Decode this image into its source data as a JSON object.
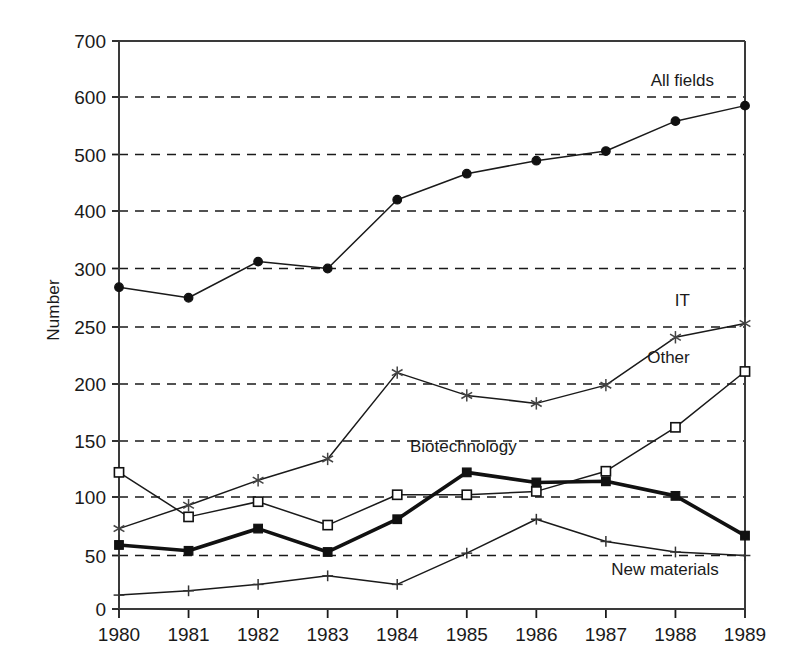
{
  "chart_data": {
    "type": "line",
    "title": "",
    "xlabel": "",
    "ylabel": "Number",
    "categories": [
      "1980",
      "1981",
      "1982",
      "1983",
      "1984",
      "1985",
      "1986",
      "1987",
      "1988",
      "1989"
    ],
    "x": [
      1980,
      1981,
      1982,
      1983,
      1984,
      1985,
      1986,
      1987,
      1988,
      1989
    ],
    "yticks": [
      0,
      50,
      100,
      150,
      200,
      250,
      300,
      400,
      500,
      600,
      700
    ],
    "ytick_labels": [
      "0",
      "50",
      "100",
      "150",
      "200",
      "250",
      "300",
      "400",
      "500",
      "600",
      "700"
    ],
    "ylim": [
      0,
      700
    ],
    "y_axis_scale": "piecewise-linear (0-300 compressed-even, 300-700 half-spacing)",
    "grid": "horizontal dashed",
    "legend_position": "inline-annotations",
    "series": [
      {
        "name": "All fields",
        "marker": "filled-circle",
        "line": "thin",
        "values": [
          284,
          275,
          312,
          300,
          420,
          466,
          489,
          506,
          558,
          585
        ],
        "label_text": "All fields"
      },
      {
        "name": "IT",
        "marker": "asterisk",
        "line": "thin",
        "values": [
          73,
          93,
          115,
          134,
          210,
          190,
          183,
          199,
          241,
          253
        ],
        "label_text": "IT"
      },
      {
        "name": "Other",
        "marker": "open-square",
        "line": "thin",
        "values": [
          122,
          83,
          96,
          76,
          102,
          102,
          105,
          123,
          162,
          211
        ],
        "label_text": "Other"
      },
      {
        "name": "Biotechnology",
        "marker": "filled-square",
        "line": "thick",
        "values": [
          59,
          54,
          73,
          53,
          81,
          122,
          113,
          114,
          101,
          67
        ],
        "label_text": "Biotechnology"
      },
      {
        "name": "New materials",
        "marker": "plus",
        "line": "thin",
        "values": [
          13,
          17,
          23,
          31,
          23,
          52,
          81,
          62,
          53,
          50
        ],
        "label_text": "New materials"
      }
    ],
    "annotations": [
      {
        "text": "All fields",
        "x": 1988.1,
        "y": 620,
        "anchor": "middle"
      },
      {
        "text": "IT",
        "x": 1988.1,
        "y": 268,
        "anchor": "middle"
      },
      {
        "text": "Other",
        "x": 1987.9,
        "y": 218,
        "anchor": "middle"
      },
      {
        "text": "Biotechnology",
        "x": 1984.95,
        "y": 140,
        "anchor": "middle"
      },
      {
        "text": "New materials",
        "x": 1987.85,
        "y": 32,
        "anchor": "middle"
      }
    ],
    "colors": {
      "axis": "#3a3a3a",
      "grid": "#1a1a1a",
      "line": "#1a1a1a",
      "background": "#ffffff"
    }
  }
}
